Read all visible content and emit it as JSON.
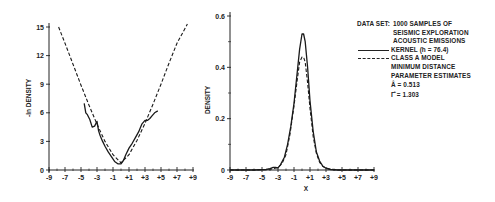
{
  "chart_data": [
    {
      "type": "line",
      "title": "",
      "xlabel": "",
      "ylabel": "-ln DENSITY",
      "xlim": [
        -9,
        9
      ],
      "ylim": [
        0,
        15
      ],
      "x_ticks": [
        "-9",
        "-7",
        "-5",
        "-3",
        "-1",
        "+1",
        "+3",
        "+5",
        "+7",
        "+9"
      ],
      "y_ticks": [
        "0",
        "3",
        "6",
        "9",
        "12",
        "15"
      ],
      "grid": false,
      "series": [
        {
          "name": "KERNEL (h = 76.4)",
          "style": "solid",
          "x": [
            -4.6,
            -4.4,
            -4.2,
            -3.9,
            -3.6,
            -3.3,
            -3.0,
            -2.8,
            -2.6,
            -2.3,
            -2.0,
            -1.6,
            -1.2,
            -0.8,
            -0.4,
            0.0,
            0.3,
            0.6,
            1.0,
            1.4,
            1.8,
            2.2,
            2.6,
            3.0,
            3.3,
            3.6,
            3.9,
            4.2,
            4.6
          ],
          "y": [
            7.0,
            6.0,
            5.8,
            5.3,
            4.5,
            4.6,
            5.1,
            4.1,
            3.6,
            3.0,
            2.5,
            1.9,
            1.4,
            0.9,
            0.65,
            0.65,
            1.0,
            1.6,
            2.3,
            2.8,
            3.4,
            4.0,
            4.8,
            5.2,
            5.2,
            5.4,
            5.7,
            6.0,
            6.2
          ]
        },
        {
          "name": "CLASS A MODEL MINIMUM DISTANCE PARAMETER ESTIMATES",
          "style": "dashed",
          "x": [
            -7.8,
            -7.0,
            -6.0,
            -5.0,
            -4.0,
            -3.0,
            -2.0,
            -1.0,
            0.0,
            1.0,
            2.0,
            3.0,
            4.0,
            5.0,
            6.0,
            7.0,
            8.3
          ],
          "y": [
            15.0,
            13.3,
            11.1,
            8.9,
            6.8,
            4.8,
            3.0,
            1.6,
            0.75,
            1.6,
            3.1,
            4.9,
            6.9,
            9.0,
            11.2,
            13.3,
            15.3
          ]
        }
      ]
    },
    {
      "type": "line",
      "title": "",
      "xlabel": "X",
      "ylabel": "DENSITY",
      "xlim": [
        -9,
        9
      ],
      "ylim": [
        0,
        0.6
      ],
      "x_ticks": [
        "-9",
        "-7",
        "-5",
        "-3",
        "-1",
        "+1",
        "+3",
        "+5",
        "+7",
        "+9"
      ],
      "y_ticks": [
        "0",
        "0.2",
        "0.4",
        "0.6"
      ],
      "grid": false,
      "series": [
        {
          "name": "KERNEL (h = 76.4)",
          "style": "solid",
          "x": [
            -9,
            -6,
            -4.5,
            -4.0,
            -3.6,
            -3.3,
            -3.0,
            -2.7,
            -2.2,
            -1.8,
            -1.4,
            -1.0,
            -0.6,
            -0.3,
            0.0,
            0.2,
            0.4,
            0.7,
            1.0,
            1.4,
            1.8,
            2.2,
            2.6,
            3.0,
            3.6,
            4.5,
            6,
            9
          ],
          "y": [
            0.0,
            0.0,
            0.002,
            0.005,
            0.01,
            0.01,
            0.008,
            0.02,
            0.05,
            0.1,
            0.17,
            0.26,
            0.38,
            0.47,
            0.53,
            0.53,
            0.5,
            0.4,
            0.27,
            0.15,
            0.07,
            0.035,
            0.015,
            0.007,
            0.002,
            0.0,
            0.0,
            0.0
          ]
        },
        {
          "name": "CLASS A MODEL MINIMUM DISTANCE PARAMETER ESTIMATES",
          "style": "dashed",
          "x": [
            -9,
            -6,
            -4.5,
            -4.0,
            -3.5,
            -3.0,
            -2.5,
            -2.0,
            -1.5,
            -1.0,
            -0.6,
            -0.3,
            0.0,
            0.2,
            0.4,
            0.7,
            1.0,
            1.4,
            1.8,
            2.2,
            2.6,
            3.0,
            3.5,
            4.5,
            6,
            9
          ],
          "y": [
            0.0,
            0.0,
            0.001,
            0.003,
            0.006,
            0.01,
            0.025,
            0.06,
            0.14,
            0.25,
            0.35,
            0.42,
            0.44,
            0.44,
            0.42,
            0.34,
            0.24,
            0.13,
            0.065,
            0.03,
            0.015,
            0.007,
            0.003,
            0.0,
            0.0,
            0.0
          ]
        }
      ]
    }
  ],
  "legend": {
    "data_set_key": "DATA SET:",
    "data_set_lines": [
      "1000 SAMPLES OF",
      "SEISMIC EXPLORATION",
      "ACOUSTIC EMISSIONS"
    ],
    "kernel_label": "KERNEL (h = 76.4)",
    "model_lines": [
      "CLASS A MODEL",
      "MINIMUM DISTANCE",
      "PARAMETER ESTIMATES"
    ],
    "a_hat": "Â = 0.513",
    "gamma_hat": "Γ̂ = 1.303"
  }
}
